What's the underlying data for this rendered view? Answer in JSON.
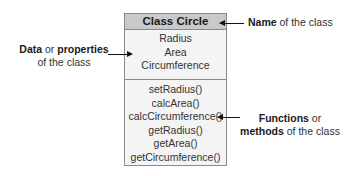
{
  "class_box": {
    "name": "Class Circle",
    "properties": [
      "Radius",
      "Area",
      "Circumference"
    ],
    "methods": [
      "setRadius()",
      "calcArea()",
      "calcCircumference()",
      "getRadius()",
      "getArea()",
      "getCircumference()"
    ]
  },
  "annotations": {
    "name": {
      "bold": "Name",
      "rest": " of the class"
    },
    "data": {
      "bold1": "Data",
      "mid": " or ",
      "bold2": "properties",
      "line2": "of the class"
    },
    "functions": {
      "bold1": "Functions",
      "mid": " or",
      "bold2": "methods",
      "line2rest": " of the class"
    }
  },
  "colors": {
    "header_bg": "#c9c9c9",
    "box_bg": "#f4f4f4",
    "border": "#8a8a8a",
    "arrow": "#111111"
  }
}
